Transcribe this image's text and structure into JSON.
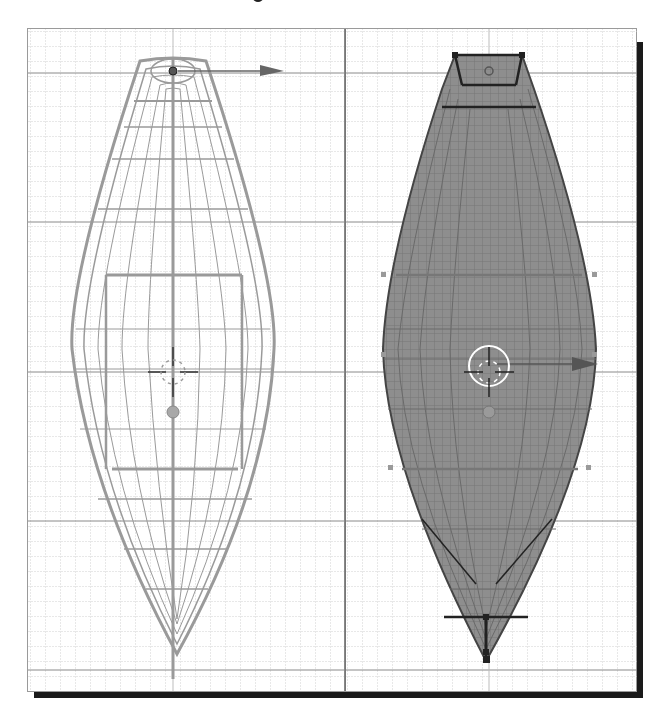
{
  "figure": {
    "colors": {
      "background": "#ffffff",
      "grid_minor": "#cfcfcf",
      "grid_major": "#8a8a8a",
      "wire_unselected": "#9a9a9a",
      "mesh_selected_fill": "#8c8c8c",
      "mesh_selected_edge": "#2a2a2a",
      "shadow": "#1a1a1a"
    }
  },
  "viewports": [
    {
      "id": "left",
      "mode": "wireframe",
      "object_state": "unselected",
      "widgets": [
        "3d-cursor-icon",
        "object-origin-icon",
        "transform-arrow-icon"
      ]
    },
    {
      "id": "right",
      "mode": "edit-mode-selected",
      "object_state": "selected",
      "widgets": [
        "3d-cursor-icon",
        "object-origin-icon",
        "transform-arrow-icon"
      ]
    }
  ]
}
